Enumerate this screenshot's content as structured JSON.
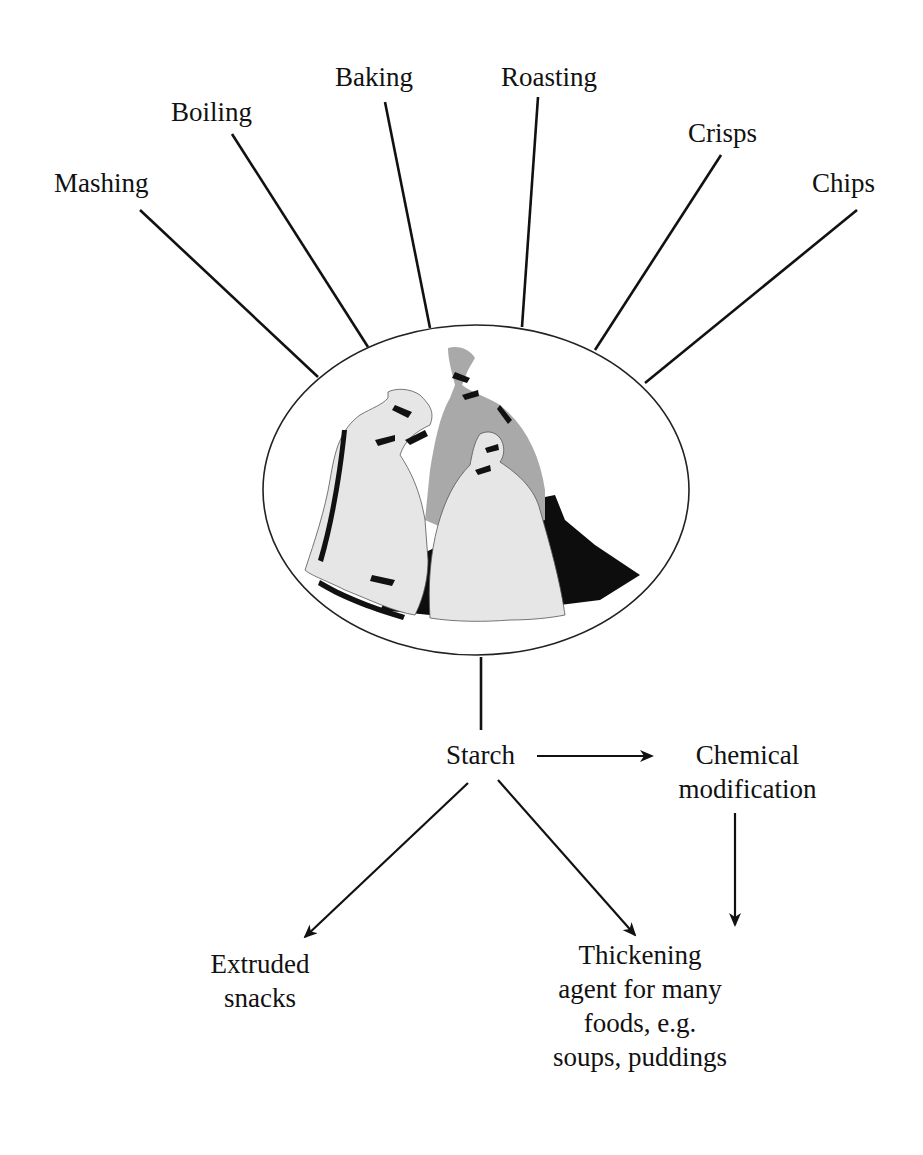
{
  "diagram": {
    "central_image": "sacks-of-potatoes",
    "cooking_methods": [
      {
        "label": "Mashing"
      },
      {
        "label": "Boiling"
      },
      {
        "label": "Baking"
      },
      {
        "label": "Roasting"
      },
      {
        "label": "Crisps"
      },
      {
        "label": "Chips"
      }
    ],
    "nodes": {
      "starch": "Starch",
      "chemical_line1": "Chemical",
      "chemical_line2": "modification",
      "extruded_line1": "Extruded",
      "extruded_line2": "snacks",
      "thickening_line1": "Thickening",
      "thickening_line2": "agent for many",
      "thickening_line3": "foods, e.g.",
      "thickening_line4": "soups, puddings"
    },
    "edges": [
      {
        "from": "Potatoes",
        "to": "Mashing",
        "type": "line"
      },
      {
        "from": "Potatoes",
        "to": "Boiling",
        "type": "line"
      },
      {
        "from": "Potatoes",
        "to": "Baking",
        "type": "line"
      },
      {
        "from": "Potatoes",
        "to": "Roasting",
        "type": "line"
      },
      {
        "from": "Potatoes",
        "to": "Crisps",
        "type": "line"
      },
      {
        "from": "Potatoes",
        "to": "Chips",
        "type": "line"
      },
      {
        "from": "Potatoes",
        "to": "Starch",
        "type": "line"
      },
      {
        "from": "Starch",
        "to": "Chemical modification",
        "type": "arrow"
      },
      {
        "from": "Starch",
        "to": "Extruded snacks",
        "type": "arrow"
      },
      {
        "from": "Starch",
        "to": "Thickening agent",
        "type": "arrow"
      },
      {
        "from": "Chemical modification",
        "to": "Thickening agent",
        "type": "arrow"
      }
    ],
    "colors": {
      "line": "#111111",
      "bag_light": "#e6e6e6",
      "bag_mid": "#a9a9a9",
      "shadow": "#0d0d0d",
      "background": "#ffffff"
    }
  }
}
